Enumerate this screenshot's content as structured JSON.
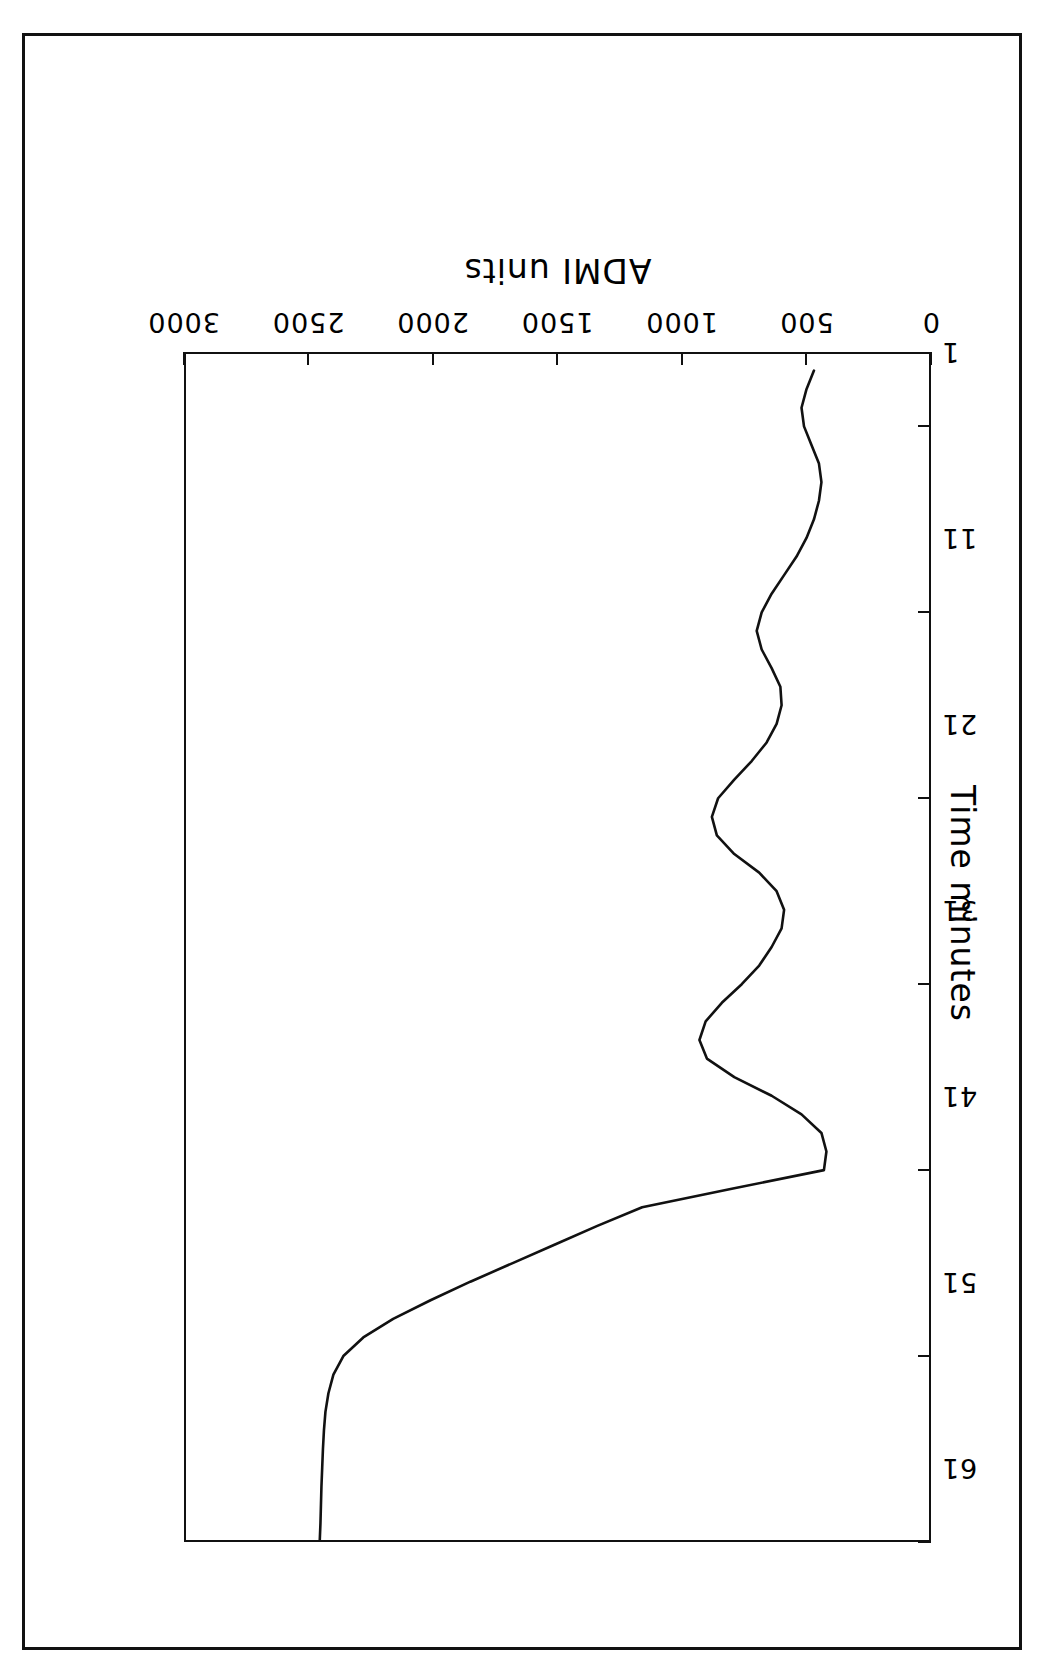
{
  "figure": {
    "orientation": "rotated-180",
    "border_color": "#111111",
    "line_color": "#111111",
    "background": "#ffffff"
  },
  "chart_data": {
    "type": "line",
    "title": "",
    "subtitle": "",
    "xlabel": "Time minutes",
    "ylabel": "ADMI units",
    "xlim": [
      1,
      65
    ],
    "ylim": [
      0,
      3000
    ],
    "xticks": [
      1,
      11,
      21,
      31,
      41,
      51,
      61
    ],
    "xticklabels": [
      "1",
      "11",
      "21",
      "31",
      "41",
      "51",
      "61"
    ],
    "yticks": [
      0,
      500,
      1000,
      1500,
      2000,
      2500,
      3000
    ],
    "yticklabels": [
      "0",
      "500",
      "1000",
      "1500",
      "2000",
      "2500",
      "3000"
    ],
    "grid": false,
    "legend": null,
    "legend_position": "none",
    "series": [
      {
        "name": "ADMI",
        "x": [
          1,
          2,
          3,
          4,
          5,
          6,
          7,
          8,
          9,
          10,
          11,
          12,
          13,
          14,
          15,
          16,
          17,
          18,
          19,
          20,
          21,
          22,
          23,
          24,
          25,
          26,
          27,
          28,
          29,
          30,
          31,
          32,
          33,
          34,
          35,
          36,
          37,
          38,
          39,
          40,
          41,
          42,
          43,
          44,
          45,
          46,
          47,
          48,
          49,
          50,
          51,
          52,
          53,
          54,
          55,
          56,
          57,
          58,
          59,
          60,
          61,
          62,
          63,
          64
        ],
        "values": [
          2455,
          2452,
          2450,
          2448,
          2445,
          2442,
          2438,
          2432,
          2420,
          2400,
          2360,
          2280,
          2160,
          2010,
          1850,
          1680,
          1510,
          1340,
          1160,
          800,
          430,
          420,
          440,
          520,
          640,
          790,
          900,
          930,
          905,
          840,
          760,
          690,
          640,
          600,
          590,
          620,
          690,
          790,
          860,
          880,
          855,
          790,
          720,
          660,
          620,
          600,
          605,
          640,
          680,
          700,
          680,
          640,
          590,
          540,
          500,
          470,
          450,
          440,
          450,
          480,
          510,
          520,
          500,
          470
        ]
      }
    ]
  },
  "axis": {
    "x_title": "Time minutes",
    "y_title": "ADMI units"
  }
}
